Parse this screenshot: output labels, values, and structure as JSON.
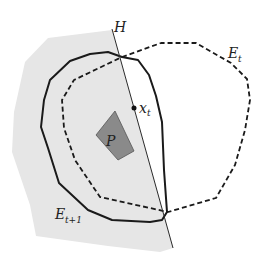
{
  "figure": {
    "width": 266,
    "height": 269,
    "colors": {
      "background": "#ffffff",
      "halfspace_fill": "#e6e6e6",
      "polytope_fill": "#8a8a8a",
      "polytope_stroke": "#555555",
      "ellipsoid_stroke": "#1a1a1a",
      "hyperplane_stroke": "#2a2a2a",
      "text": "#222222"
    },
    "labels": {
      "hyperplane": "H",
      "ellipsoid_current_main": "E",
      "ellipsoid_current_sub": "t",
      "ellipsoid_next_main": "E",
      "ellipsoid_next_sub": "t+1",
      "center_point_main": "x",
      "center_point_sub": "t",
      "polytope": "P"
    },
    "shapes": {
      "halfspace_region": "48,38 112,30 173,248 160,252 108,246 36,236 30,205 12,152 14,112 25,62",
      "ellipsoid_next_points": "70,61 90,54 108,52 122,57 138,60 149,75 156,96 162,122 164,170 167,212 162,220 150,222 112,220 88,210 59,183 48,148 41,127 44,100 50,80",
      "ellipsoid_current_points": "122,57 161,43 196,43 231,63 247,79 250,100 245,130 235,165 216,198 168,212 100,197 75,160 64,128 62,100 74,80",
      "hyperplane_line": {
        "x1": 112,
        "y1": 29,
        "x2": 173,
        "y2": 248
      },
      "center_point": {
        "cx": 134,
        "cy": 108,
        "r": 2.5
      },
      "polytope_points": "96,135 115,111 134,151 118,160"
    }
  }
}
